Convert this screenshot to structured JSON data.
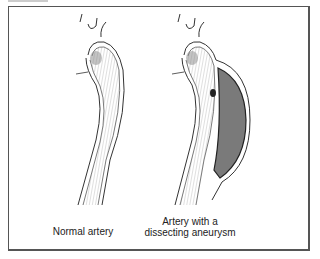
{
  "figure": {
    "labels": {
      "normal": "Normal artery",
      "dissecting_line1": "Artery with a",
      "dissecting_line2": "dissecting aneurysm"
    },
    "colors": {
      "line": "#333333",
      "blood_fill": "#7a7a7a",
      "frame": "#555555"
    }
  }
}
